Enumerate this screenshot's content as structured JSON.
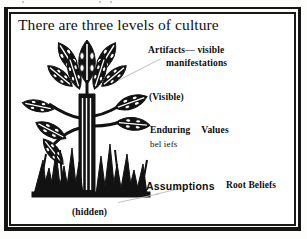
{
  "document": {
    "title": "There are three levels of culture"
  },
  "diagram": {
    "name": "levels-of-culture-plant",
    "illustration_label": "plant-tree-illustration",
    "ink_color": "#121212",
    "background_color": "#ffffff",
    "leader_line_color": "#b9b9b9",
    "labels": {
      "artifacts_line1": "Artifacts— visible",
      "artifacts_line2": "manifestations",
      "visible": "(Visible)",
      "enduring": "Enduring",
      "values": "Values",
      "beliefs": "bel iefs",
      "assumptions": "Assumptions",
      "root_beliefs": "Root Beliefs",
      "hidden": "(hidden)"
    }
  }
}
